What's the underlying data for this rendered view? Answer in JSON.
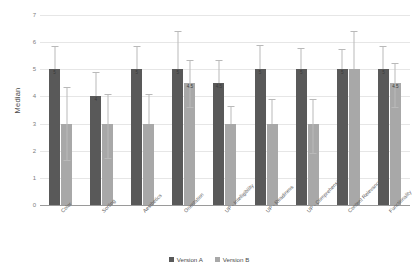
{
  "chart_data": {
    "type": "bar",
    "title": "",
    "xlabel": "",
    "ylabel": "Median",
    "ylim": [
      0,
      7
    ],
    "yticks": [
      0,
      1,
      2,
      3,
      4,
      5,
      6,
      7
    ],
    "grid": true,
    "legend_position": "bottom",
    "categories": [
      "Color",
      "Sorting",
      "Aesthetics",
      "Orientation",
      "UP - Intelligibility",
      "UP - Readiness",
      "UP - Comprehension",
      "Content Relevance",
      "Functionality"
    ],
    "series": [
      {
        "name": "Version A",
        "color": "#595959",
        "values": [
          5,
          4,
          5,
          5,
          4.5,
          5,
          5,
          5,
          5
        ],
        "labels": [
          "5",
          "4",
          "5",
          "5",
          "4.5",
          "5",
          "5",
          "5",
          "5"
        ],
        "err_upper": [
          0.85,
          0.9,
          0.85,
          1.4,
          0.85,
          0.9,
          0.8,
          0.75,
          0.85
        ],
        "err_lower": [
          0,
          0,
          0,
          0,
          0,
          0,
          0,
          0,
          0
        ]
      },
      {
        "name": "Version B",
        "color": "#a8a8a8",
        "values": [
          3,
          3,
          3,
          4.5,
          3,
          3,
          3,
          5,
          4.5
        ],
        "labels": [
          "",
          "",
          "",
          "4.5",
          "",
          "",
          "",
          "",
          "4.5"
        ],
        "err_upper": [
          1.35,
          1.1,
          1.1,
          0.85,
          0.65,
          0.9,
          0.9,
          1.4,
          0.75
        ],
        "err_lower": [
          1.35,
          1.25,
          0,
          0.9,
          0,
          0,
          1.1,
          0,
          0.9
        ]
      }
    ]
  },
  "axis": {
    "y_title": "Median",
    "tick_labels": [
      "7",
      "6",
      "5",
      "4",
      "3",
      "2",
      "1",
      "0"
    ]
  },
  "legend": {
    "items": [
      {
        "label": "Version A",
        "color": "#595959"
      },
      {
        "label": "Version B",
        "color": "#a8a8a8"
      }
    ]
  }
}
